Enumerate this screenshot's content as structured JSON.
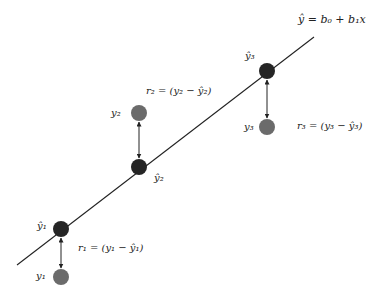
{
  "diagram": {
    "regression_line": {
      "equation": "ŷ = b₀ + b₁x",
      "from": [
        17,
        265
      ],
      "to": [
        314,
        37
      ],
      "color": "#222222"
    },
    "colors": {
      "predicted_point": "#252525",
      "observed_point": "#6b6b6b",
      "line": "#222222",
      "text": "#222222"
    },
    "points": [
      {
        "id": 1,
        "predicted_label": "ŷ₁",
        "observed_label": "y₁",
        "residual_label": "r₁ = (y₁ − ŷ₁)",
        "predicted_xy": [
          61,
          229
        ],
        "observed_xy": [
          61,
          277
        ]
      },
      {
        "id": 2,
        "predicted_label": "ŷ₂",
        "observed_label": "y₂",
        "residual_label": "r₂ = (y₂ − ŷ₂)",
        "predicted_xy": [
          139,
          167
        ],
        "observed_xy": [
          139,
          113
        ]
      },
      {
        "id": 3,
        "predicted_label": "ŷ₃",
        "observed_label": "y₃",
        "residual_label": "r₃ = (y₃ − ŷ₃)",
        "predicted_xy": [
          267,
          71
        ],
        "observed_xy": [
          267,
          127
        ]
      }
    ]
  }
}
